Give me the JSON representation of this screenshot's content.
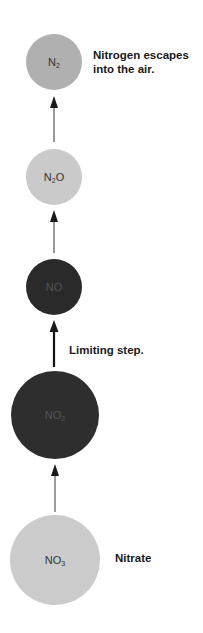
{
  "diagram": {
    "colors": {
      "light_node": "#c8c8c8",
      "mid_node": "#ababab",
      "dark_node": "#2b2b2b",
      "arrow": "#555555",
      "arrow_limiting": "#111111",
      "label_text": "#1a1a1a"
    },
    "nodes": [
      {
        "id": "n2",
        "base": "N",
        "sub": "2",
        "suffix": "",
        "cx": 54,
        "cy": 62,
        "r": 28,
        "fill": "#b0b0b0",
        "text_color": "#333333"
      },
      {
        "id": "n2o",
        "base": "N",
        "sub": "2",
        "suffix": "O",
        "cx": 54,
        "cy": 177,
        "r": 28,
        "fill": "#cacaca",
        "text_color": "#333333"
      },
      {
        "id": "no",
        "base": "NO",
        "sub": "",
        "suffix": "",
        "cx": 54,
        "cy": 287,
        "r": 28,
        "fill": "#2a2a2a",
        "text_color": "#555555"
      },
      {
        "id": "no2",
        "base": "NO",
        "sub": "2",
        "suffix": "",
        "cx": 55,
        "cy": 415,
        "r": 44,
        "fill": "#2e2e2e",
        "text_color": "#555555"
      },
      {
        "id": "no3",
        "base": "NO",
        "sub": "3",
        "suffix": "",
        "cx": 55,
        "cy": 560,
        "r": 45,
        "fill": "#cbcbcb",
        "text_color": "#333333"
      }
    ],
    "edges": [
      {
        "from": "n2o",
        "to": "n2",
        "x": 54,
        "y1": 142,
        "y2": 96,
        "limiting": false
      },
      {
        "from": "no",
        "to": "n2o",
        "x": 54,
        "y1": 253,
        "y2": 210,
        "limiting": false
      },
      {
        "from": "no2",
        "to": "no",
        "x": 54,
        "y1": 367,
        "y2": 320,
        "limiting": true
      },
      {
        "from": "no3",
        "to": "no2",
        "x": 55,
        "y1": 512,
        "y2": 464,
        "limiting": false
      }
    ],
    "labels": [
      {
        "id": "n2-label",
        "lines": [
          "Nitrogen escapes",
          "into the air."
        ],
        "x": 93,
        "y": 48
      },
      {
        "id": "limiting-label",
        "lines": [
          "Limiting step."
        ],
        "x": 69,
        "y": 343
      },
      {
        "id": "nitrate-label",
        "lines": [
          "Nitrate"
        ],
        "x": 115,
        "y": 551
      }
    ]
  }
}
